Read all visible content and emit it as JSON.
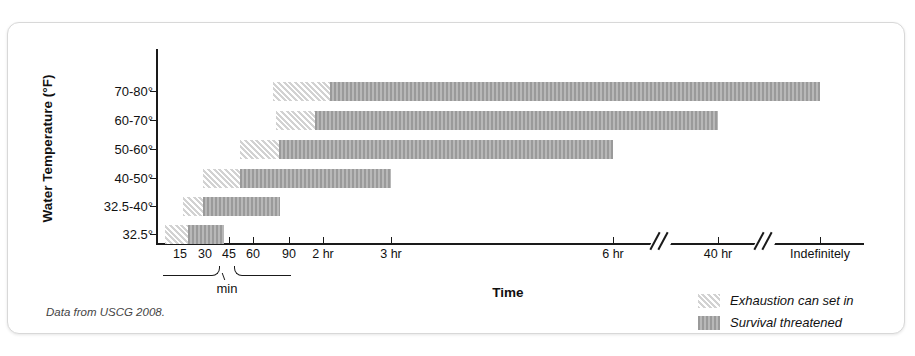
{
  "figure": {
    "source_note": "Data from USCG 2008.",
    "x_axis_label": "Time",
    "y_axis_label": "Water Temperature (°F)",
    "min_brace_label": "min"
  },
  "legend": {
    "position": "bottom-right",
    "items": [
      {
        "label": "Exhaustion can set in",
        "pattern": "diagonal-hatch",
        "color": "#d2d2d2"
      },
      {
        "label": "Survival threatened",
        "pattern": "vertical-stripe",
        "color": "#9a9a9a"
      }
    ]
  },
  "x_ticks": [
    {
      "label": "15",
      "x": 172
    },
    {
      "label": "30",
      "x": 197
    },
    {
      "label": "45",
      "x": 221
    },
    {
      "label": "60",
      "x": 245
    },
    {
      "label": "90",
      "x": 281
    },
    {
      "label": "2 hr",
      "x": 315
    },
    {
      "label": "3 hr",
      "x": 383
    },
    {
      "label": "6 hr",
      "x": 605
    },
    {
      "label": "40 hr",
      "x": 710
    },
    {
      "label": "Indefinitely",
      "x": 812
    }
  ],
  "axis_breaks": [
    {
      "x": 648
    },
    {
      "x": 752
    }
  ],
  "chart_data": {
    "type": "bar",
    "orientation": "horizontal",
    "title": "",
    "subtitle": "",
    "xlabel": "Time",
    "ylabel": "Water Temperature (°F)",
    "grid": false,
    "legend_position": "bottom-right",
    "note": "Horizontal range (Gantt-style) chart: each water-temperature band shows the time window in which exhaustion can set in, followed by the window in which survival is threatened. Time axis is non-linear with two breaks.",
    "x_tick_labels": [
      "15",
      "30",
      "45",
      "60",
      "90",
      "2 hr",
      "3 hr",
      "6 hr",
      "40 hr",
      "Indefinitely"
    ],
    "categories": [
      "70-80°",
      "60-70°",
      "50-60°",
      "40-50°",
      "32.5-40°",
      "32.5°"
    ],
    "series": [
      {
        "name": "Exhaustion can set in",
        "color": "#d2d2d2",
        "ranges": [
          {
            "category": "70-80°",
            "start_label": "2 hr",
            "end_label": "3 hr",
            "px_start": 265,
            "px_end": 322
          },
          {
            "category": "60-70°",
            "start_label": "2 hr",
            "end_label": "2 hr",
            "px_start": 268,
            "px_end": 307
          },
          {
            "category": "50-60°",
            "start_label": "60 min",
            "end_label": "2 hr",
            "px_start": 232,
            "px_end": 271
          },
          {
            "category": "40-50°",
            "start_label": "30 min",
            "end_label": "60 min",
            "px_start": 195,
            "px_end": 232
          },
          {
            "category": "32.5-40°",
            "start_label": "15 min",
            "end_label": "30 min",
            "px_start": 175,
            "px_end": 195
          },
          {
            "category": "32.5°",
            "start_label": "0 min",
            "end_label": "15 min",
            "px_start": 157,
            "px_end": 180
          }
        ]
      },
      {
        "name": "Survival threatened",
        "color": "#9a9a9a",
        "ranges": [
          {
            "category": "70-80°",
            "start_label": "3 hr",
            "end_label": "Indefinitely",
            "px_start": 322,
            "px_end": 812
          },
          {
            "category": "60-70°",
            "start_label": "2 hr",
            "end_label": "40 hr",
            "px_start": 307,
            "px_end": 710
          },
          {
            "category": "50-60°",
            "start_label": "2 hr",
            "end_label": "6 hr",
            "px_start": 271,
            "px_end": 605
          },
          {
            "category": "40-50°",
            "start_label": "60 min",
            "end_label": "3 hr",
            "px_start": 232,
            "px_end": 383
          },
          {
            "category": "32.5-40°",
            "start_label": "30 min",
            "end_label": "90 min",
            "px_start": 195,
            "px_end": 272
          },
          {
            "category": "32.5°",
            "start_label": "15 min",
            "end_label": "45 min",
            "px_start": 180,
            "px_end": 216
          }
        ]
      }
    ]
  },
  "row_geometry": [
    {
      "category": "70-80°",
      "y_center": 68
    },
    {
      "category": "60-70°",
      "y_center": 97
    },
    {
      "category": "50-60°",
      "y_center": 126
    },
    {
      "category": "40-50°",
      "y_center": 155
    },
    {
      "category": "32.5-40°",
      "y_center": 183
    },
    {
      "category": "32.5°",
      "y_center": 211
    }
  ]
}
